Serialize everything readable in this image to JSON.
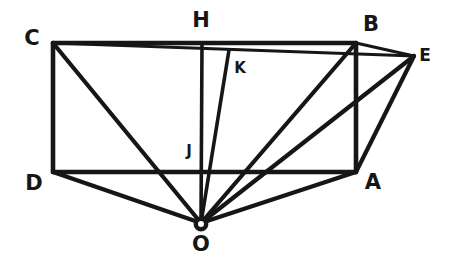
{
  "figure": {
    "kind": "hand-drawn-geometry-diagram",
    "ink_color": "#161616",
    "background_color": "#ffffff",
    "points": {
      "C": {
        "label": "C",
        "x": 53,
        "y": 43,
        "label_x": 32,
        "label_y": 38,
        "size": "lbl-big"
      },
      "H": {
        "label": "H",
        "x": 202,
        "y": 43,
        "label_x": 201,
        "label_y": 20,
        "size": "lbl-big"
      },
      "B": {
        "label": "B",
        "x": 356,
        "y": 43,
        "label_x": 371,
        "label_y": 24,
        "size": "lbl-big"
      },
      "E": {
        "label": "E",
        "x": 414,
        "y": 56,
        "label_x": 425,
        "label_y": 55,
        "size": "lbl-mid"
      },
      "K": {
        "label": "K",
        "x": 229,
        "y": 50,
        "label_x": 240,
        "label_y": 68,
        "size": "lbl-sml"
      },
      "J": {
        "label": "J",
        "x": 202,
        "y": 172,
        "label_x": 189,
        "label_y": 151,
        "size": "lbl-sml"
      },
      "D": {
        "label": "D",
        "x": 53,
        "y": 172,
        "label_x": 34,
        "label_y": 183,
        "size": "lbl-big"
      },
      "A": {
        "label": "A",
        "x": 356,
        "y": 172,
        "label_x": 373,
        "label_y": 182,
        "size": "lbl-big"
      },
      "O": {
        "label": "O",
        "x": 201,
        "y": 223,
        "label_x": 201,
        "label_y": 244,
        "size": "lbl-big"
      }
    },
    "segments": [
      {
        "name": "edge-C-B",
        "from": "C",
        "to": "B",
        "width": 4.6
      },
      {
        "name": "edge-C-D",
        "from": "C",
        "to": "D",
        "width": 4.6
      },
      {
        "name": "edge-D-A",
        "from": "D",
        "to": "A",
        "width": 4.6
      },
      {
        "name": "edge-B-A",
        "from": "B",
        "to": "A",
        "width": 4.6
      },
      {
        "name": "edge-C-E",
        "from": "C",
        "to": "E",
        "width": 3.2
      },
      {
        "name": "edge-B-E",
        "from": "B",
        "to": "E",
        "width": 3.2
      },
      {
        "name": "edge-A-E",
        "from": "A",
        "to": "E",
        "width": 4.2
      },
      {
        "name": "edge-C-O",
        "from": "C",
        "to": "O",
        "width": 4.2
      },
      {
        "name": "edge-D-O",
        "from": "D",
        "to": "O",
        "width": 4.2
      },
      {
        "name": "edge-H-O",
        "from": "H",
        "to": "O",
        "width": 3.6
      },
      {
        "name": "edge-K-O",
        "from": "K",
        "to": "O",
        "width": 3.6
      },
      {
        "name": "edge-B-O",
        "from": "B",
        "to": "O",
        "width": 4.2
      },
      {
        "name": "edge-A-O",
        "from": "A",
        "to": "O",
        "width": 4.2
      },
      {
        "name": "edge-E-O",
        "from": "E",
        "to": "O",
        "width": 4.2
      }
    ],
    "vertex_dot": {
      "name": "point-O-marker",
      "cx": 201,
      "cy": 224,
      "r": 5.2,
      "stroke": 4.4
    }
  },
  "chart_data": {
    "type": "diagram",
    "title": "",
    "labels": [
      "C",
      "H",
      "B",
      "E",
      "K",
      "J",
      "D",
      "A",
      "O"
    ],
    "coordinates": {
      "C": [
        53,
        43
      ],
      "H": [
        202,
        43
      ],
      "B": [
        356,
        43
      ],
      "E": [
        414,
        56
      ],
      "K": [
        229,
        50
      ],
      "J": [
        202,
        172
      ],
      "D": [
        53,
        172
      ],
      "A": [
        356,
        172
      ],
      "O": [
        201,
        223
      ]
    },
    "connections": [
      [
        "C",
        "B"
      ],
      [
        "C",
        "D"
      ],
      [
        "D",
        "A"
      ],
      [
        "B",
        "A"
      ],
      [
        "C",
        "E"
      ],
      [
        "B",
        "E"
      ],
      [
        "A",
        "E"
      ],
      [
        "C",
        "O"
      ],
      [
        "D",
        "O"
      ],
      [
        "H",
        "O"
      ],
      [
        "K",
        "O"
      ],
      [
        "B",
        "O"
      ],
      [
        "A",
        "O"
      ],
      [
        "E",
        "O"
      ]
    ]
  }
}
